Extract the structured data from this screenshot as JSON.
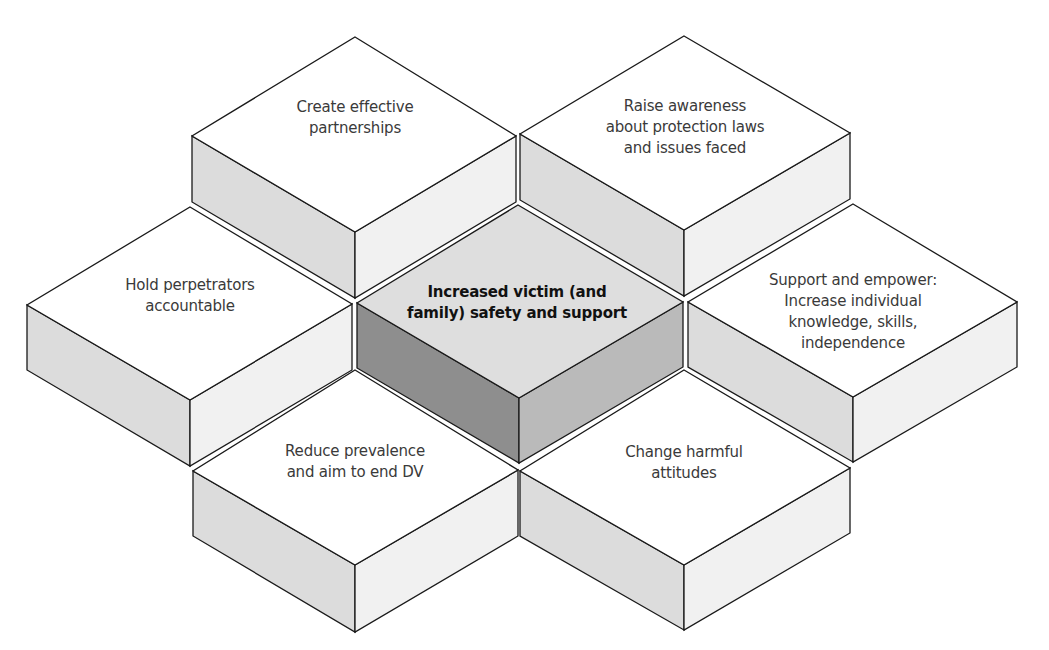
{
  "diagram": {
    "type": "isometric-hexagon-blocks",
    "colors": {
      "outline": "#1a1a1a",
      "gap": "#ffffff",
      "outer_top": "#ffffff",
      "outer_left_side": "#dcdcdc",
      "outer_right_side": "#f1f1f1",
      "center_top": "#dedede",
      "center_left_side": "#8e8e8e",
      "center_right_side": "#bababa"
    },
    "center": {
      "label": "Increased victim (and\nfamily) safety and support"
    },
    "blocks": [
      {
        "id": "top-left",
        "label": "Create effective\npartnerships"
      },
      {
        "id": "top-right",
        "label": "Raise awareness\nabout protection laws\nand issues faced"
      },
      {
        "id": "left",
        "label": "Hold perpetrators\naccountable"
      },
      {
        "id": "right",
        "label": "Support and empower:\nIncrease individual\nknowledge, skills,\nindependence"
      },
      {
        "id": "bottom-left",
        "label": "Reduce prevalence\nand aim to end DV"
      },
      {
        "id": "bottom-right",
        "label": "Change harmful\nattitudes"
      }
    ]
  }
}
